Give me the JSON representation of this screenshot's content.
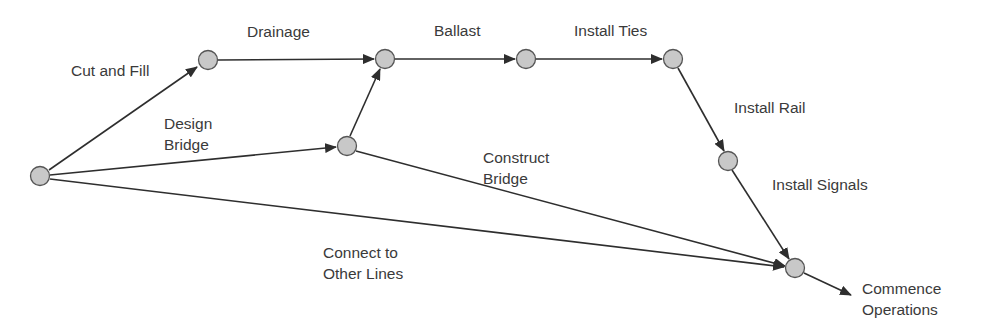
{
  "diagram": {
    "type": "activity-on-arrow network",
    "colors": {
      "node_fill": "#c8c8c8",
      "node_stroke": "#555555",
      "edge": "#2e2e2e",
      "text": "#3a3a3a"
    },
    "nodes": [
      {
        "id": "n0",
        "x": 40,
        "y": 176
      },
      {
        "id": "n1",
        "x": 208,
        "y": 60
      },
      {
        "id": "n2",
        "x": 385,
        "y": 59
      },
      {
        "id": "n3",
        "x": 347,
        "y": 146
      },
      {
        "id": "n4",
        "x": 526,
        "y": 59
      },
      {
        "id": "n5",
        "x": 673,
        "y": 59
      },
      {
        "id": "n6",
        "x": 728,
        "y": 161
      },
      {
        "id": "n7",
        "x": 795,
        "y": 268
      }
    ],
    "activities": {
      "cut_and_fill": "Cut and Fill",
      "drainage": "Drainage",
      "design_bridge": "Design\nBridge",
      "ballast": "Ballast",
      "install_ties": "Install Ties",
      "install_rail": "Install Rail",
      "construct_bridge": "Construct\nBridge",
      "install_signals": "Install Signals",
      "connect_lines": "Connect to\nOther Lines",
      "commence_operations": "Commence\nOperations"
    }
  }
}
